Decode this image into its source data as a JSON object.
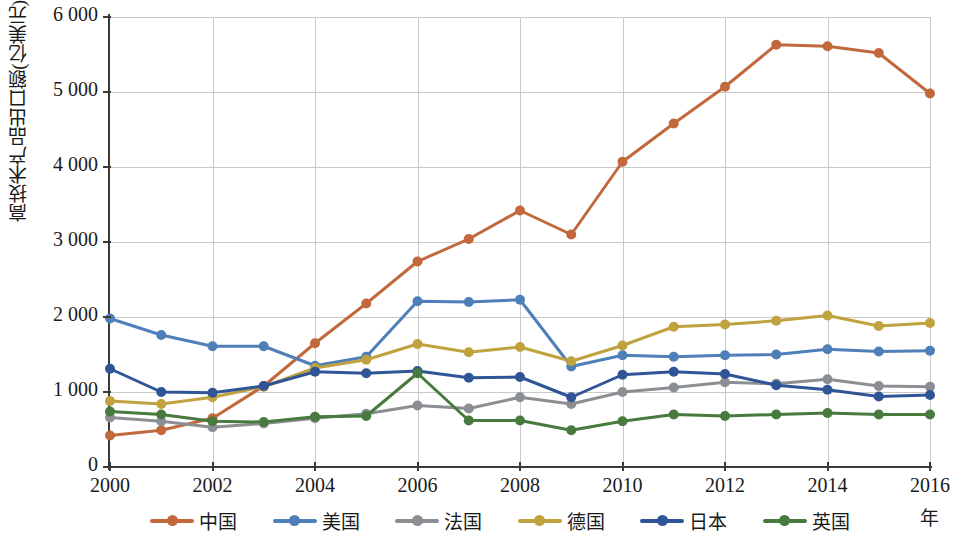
{
  "chart_data": {
    "type": "line",
    "title": "",
    "xlabel": "年",
    "ylabel": "高技术产品出口额(亿美元)",
    "x": [
      2000,
      2001,
      2002,
      2003,
      2004,
      2005,
      2006,
      2007,
      2008,
      2009,
      2010,
      2011,
      2012,
      2013,
      2014,
      2015,
      2016
    ],
    "xlim": [
      2000,
      2016
    ],
    "ylim": [
      0,
      6000
    ],
    "xticks": [
      "2000",
      "2002",
      "2004",
      "2006",
      "2008",
      "2010",
      "2012",
      "2014",
      "2016"
    ],
    "yticks": [
      "0",
      "1 000",
      "2 000",
      "3 000",
      "4 000",
      "5 000",
      "6 000"
    ],
    "ytick_values": [
      0,
      1000,
      2000,
      3000,
      4000,
      5000,
      6000
    ],
    "xtick_values": [
      2000,
      2002,
      2004,
      2006,
      2008,
      2010,
      2012,
      2014,
      2016
    ],
    "grid": true,
    "legend_position": "bottom",
    "series": [
      {
        "name": "中国",
        "color": "#C1693C",
        "values": [
          420,
          490,
          650,
          1080,
          1650,
          2180,
          2740,
          3040,
          3420,
          3100,
          4070,
          4580,
          5070,
          5630,
          5610,
          5520,
          4980
        ]
      },
      {
        "name": "美国",
        "color": "#4E7FB8",
        "values": [
          1980,
          1760,
          1610,
          1610,
          1350,
          1470,
          2210,
          2200,
          2230,
          1340,
          1490,
          1470,
          1490,
          1500,
          1570,
          1540,
          1550
        ]
      },
      {
        "name": "法国",
        "color": "#8B8F93",
        "values": [
          660,
          610,
          530,
          580,
          650,
          710,
          820,
          780,
          930,
          840,
          1000,
          1060,
          1130,
          1110,
          1170,
          1080,
          1070
        ]
      },
      {
        "name": "德国",
        "color": "#C0A23E",
        "values": [
          880,
          840,
          930,
          1070,
          1320,
          1430,
          1640,
          1530,
          1600,
          1410,
          1620,
          1870,
          1900,
          1950,
          2020,
          1880,
          1920
        ]
      },
      {
        "name": "日本",
        "color": "#2F5596",
        "values": [
          1310,
          1000,
          990,
          1080,
          1270,
          1250,
          1280,
          1190,
          1200,
          930,
          1230,
          1270,
          1240,
          1090,
          1030,
          940,
          960
        ]
      },
      {
        "name": "英国",
        "color": "#487A3E",
        "values": [
          740,
          700,
          610,
          600,
          670,
          680,
          1250,
          620,
          620,
          490,
          610,
          700,
          680,
          700,
          720,
          700,
          700
        ]
      }
    ]
  },
  "legend": {
    "items": [
      {
        "label": "中国",
        "color": "#C1693C",
        "icon": "line-marker-icon"
      },
      {
        "label": "美国",
        "color": "#4E7FB8",
        "icon": "line-marker-icon"
      },
      {
        "label": "法国",
        "color": "#8B8F93",
        "icon": "line-marker-icon"
      },
      {
        "label": "德国",
        "color": "#C0A23E",
        "icon": "line-marker-icon"
      },
      {
        "label": "日本",
        "color": "#2F5596",
        "icon": "line-marker-icon"
      },
      {
        "label": "英国",
        "color": "#487A3E",
        "icon": "line-marker-icon"
      }
    ]
  },
  "axes": {
    "y_title": "高技术产品出口额(亿美元)",
    "x_unit": "年"
  }
}
